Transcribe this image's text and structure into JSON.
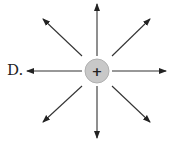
{
  "option_label": "D.",
  "charge": {
    "sign": "+",
    "cx": 97,
    "cy": 71,
    "r": 12,
    "fill": "#c8c8c8",
    "stroke": "#b0b0b0"
  },
  "arrow_color": "#333333",
  "field_lines": [
    {
      "direction": "up",
      "x1": 97,
      "y1": 56,
      "x2": 97,
      "y2": 4
    },
    {
      "direction": "down",
      "x1": 97,
      "y1": 86,
      "x2": 97,
      "y2": 138
    },
    {
      "direction": "left",
      "x1": 82,
      "y1": 71,
      "x2": 27,
      "y2": 71
    },
    {
      "direction": "right",
      "x1": 112,
      "y1": 71,
      "x2": 166,
      "y2": 71
    },
    {
      "direction": "up-left",
      "x1": 82,
      "y1": 56,
      "x2": 43,
      "y2": 19
    },
    {
      "direction": "up-right",
      "x1": 112,
      "y1": 56,
      "x2": 150,
      "y2": 19
    },
    {
      "direction": "down-left",
      "x1": 82,
      "y1": 86,
      "x2": 43,
      "y2": 122
    },
    {
      "direction": "down-right",
      "x1": 112,
      "y1": 86,
      "x2": 150,
      "y2": 122
    }
  ]
}
